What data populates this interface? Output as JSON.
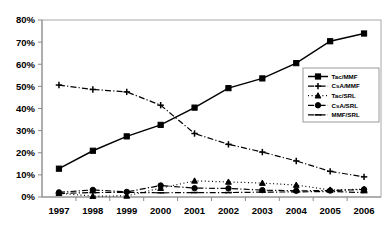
{
  "chart_data": {
    "type": "line",
    "title": "",
    "subtitle": "",
    "xlabel": "",
    "ylabel": "",
    "categories": [
      "1997",
      "1998",
      "1999",
      "2000",
      "2001",
      "2002",
      "2003",
      "2004",
      "2005",
      "2006"
    ],
    "x_tick_labels": [
      "1997",
      "1998",
      "1999",
      "2000",
      "2001",
      "2002",
      "2003",
      "2004",
      "2005",
      "2006"
    ],
    "y_tick_labels": [
      "0%",
      "10%",
      "20%",
      "30%",
      "40%",
      "50%",
      "60%",
      "70%",
      "80%"
    ],
    "y_tick_values": [
      0,
      10,
      20,
      30,
      40,
      50,
      60,
      70,
      80
    ],
    "ylim": [
      0,
      80
    ],
    "grid": false,
    "legend_position": "right-middle",
    "units": "percent",
    "series": [
      {
        "name": "Tac/MMF",
        "marker": "square",
        "dash": "solid",
        "values": [
          12.8,
          20.9,
          27.4,
          32.6,
          40.4,
          49.2,
          53.6,
          60.5,
          70.4,
          73.9
        ]
      },
      {
        "name": "CsA/MMF",
        "marker": "cross",
        "dash": "dashdot",
        "values": [
          50.6,
          48.6,
          47.5,
          41.5,
          28.7,
          23.8,
          20.3,
          16.3,
          11.6,
          9.1
        ]
      },
      {
        "name": "Tac/SRL",
        "marker": "triangle",
        "dash": "dotted",
        "values": [
          1.7,
          0.4,
          0.5,
          4.0,
          7.3,
          6.8,
          6.3,
          5.4,
          3.2,
          3.5
        ]
      },
      {
        "name": "CsA/SRL",
        "marker": "circle",
        "dash": "dashdot",
        "values": [
          2.1,
          3.2,
          2.3,
          5.2,
          4.0,
          3.9,
          3.1,
          2.8,
          2.9,
          3.4
        ]
      },
      {
        "name": "MMF/SRL",
        "marker": "dash",
        "dash": "dashdot",
        "values": [
          1.6,
          2.0,
          2.1,
          1.9,
          2.0,
          2.0,
          2.2,
          2.3,
          2.5,
          2.0
        ]
      }
    ]
  },
  "legend": {
    "entries": [
      {
        "label": "Tac/MMF"
      },
      {
        "label": "CsA/MMF"
      },
      {
        "label": "Tac/SRL"
      },
      {
        "label": "CsA/SRL"
      },
      {
        "label": "MMF/SRL"
      }
    ]
  },
  "colors": {
    "series": "#000000",
    "axis": "#8a8a8a",
    "plot_border": "#a8a8a8",
    "background": "#ffffff",
    "text": "#000000"
  }
}
